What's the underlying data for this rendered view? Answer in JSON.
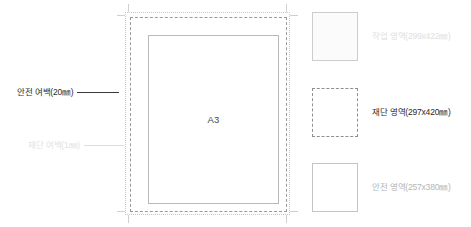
{
  "diagram": {
    "paper_size_label": "A3",
    "callouts": [
      {
        "name": "safety-margin",
        "label": "안전 여백(20㎜)"
      },
      {
        "name": "trim-margin",
        "label": "재단 여백(1㎜)"
      }
    ]
  },
  "legend": {
    "items": [
      {
        "name": "work-area",
        "label": "작업 영역(299x422㎜)",
        "swatch_style": "solid-tinted",
        "text_color": "#e0e0e0",
        "border_color": "#cdcdcd"
      },
      {
        "name": "trim-area",
        "label": "재단 영역(297x420㎜)",
        "swatch_style": "dashed",
        "text_color": "#2b2b2b",
        "border_color": "#8f8f8f"
      },
      {
        "name": "safety-area",
        "label": "안전 영역(257x380㎜)",
        "swatch_style": "solid",
        "text_color": "#b5b5b5",
        "border_color": "#c4c4c4"
      }
    ]
  },
  "colors": {
    "background": "#ffffff",
    "crop_mark": "#cfcfcf",
    "work_border": "#c8c8c8",
    "trim_border": "#9a9a9a",
    "safe_border": "#b9b9b9",
    "marker_dark": "#1d1d1d",
    "marker_faint": "#d3d3d3"
  }
}
